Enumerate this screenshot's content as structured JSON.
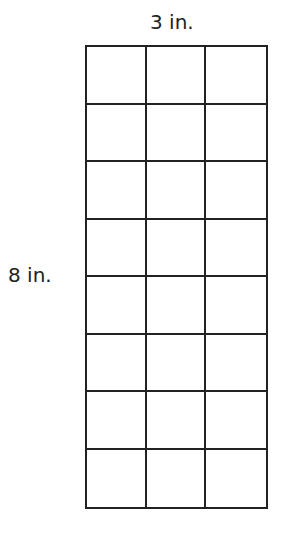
{
  "diagram": {
    "width_label": "3 in.",
    "height_label": "8 in.",
    "columns": 3,
    "rows": 8,
    "line_color": "#222222"
  }
}
